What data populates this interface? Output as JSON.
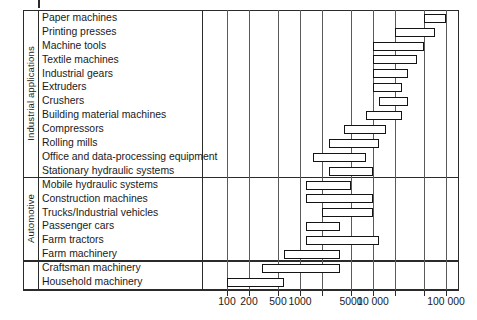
{
  "chart_data": {
    "type": "bar",
    "orientation": "horizontal",
    "title": "",
    "xlabel": "",
    "ylabel": "",
    "xscale": "log",
    "xlim": [
      100,
      150000
    ],
    "grid": true,
    "legend": null,
    "axis_ticks": [
      {
        "value": 100,
        "label": "100"
      },
      {
        "value": 200,
        "label": "200"
      },
      {
        "value": 500,
        "label": "500"
      },
      {
        "value": 1000,
        "label": "1000"
      },
      {
        "value": 5000,
        "label": "5000"
      },
      {
        "value": 10000,
        "label": "10 000"
      },
      {
        "value": 100000,
        "label": "100 000"
      }
    ],
    "gridline_values": [
      100,
      200,
      500,
      1000,
      2000,
      5000,
      10000,
      20000,
      50000,
      100000
    ],
    "groups": [
      {
        "name": "Industrial applications",
        "rows": 12
      },
      {
        "name": "Automotive",
        "rows": 6
      },
      {
        "name": "",
        "rows": 2
      }
    ],
    "categories": [
      "Paper machines",
      "Printing presses",
      "Machine tools",
      "Textile machines",
      "Industrial gears",
      "Extruders",
      "Crushers",
      "Building material machines",
      "Compressors",
      "Rolling mills",
      "Office and data-processing equipment",
      "Stationary hydraulic systems",
      "Mobile hydraulic systems",
      "Construction machines",
      "Trucks/Industrial vehicles",
      "Passenger cars",
      "Farm tractors",
      "Farm machinery",
      "Craftsman machinery",
      "Household machinery"
    ],
    "ranges": [
      {
        "category": "Paper machines",
        "low": 50000,
        "high": 100000
      },
      {
        "category": "Printing presses",
        "low": 20000,
        "high": 70000
      },
      {
        "category": "Machine tools",
        "low": 10000,
        "high": 50000
      },
      {
        "category": "Textile machines",
        "low": 10000,
        "high": 40000
      },
      {
        "category": "Industrial gears",
        "low": 10000,
        "high": 30000
      },
      {
        "category": "Extruders",
        "low": 10000,
        "high": 25000
      },
      {
        "category": "Crushers",
        "low": 12000,
        "high": 30000
      },
      {
        "category": "Building material machines",
        "low": 8000,
        "high": 25000
      },
      {
        "category": "Compressors",
        "low": 4000,
        "high": 15000
      },
      {
        "category": "Rolling mills",
        "low": 2500,
        "high": 12000
      },
      {
        "category": "Office and data-processing equipment",
        "low": 1500,
        "high": 8000
      },
      {
        "category": "Stationary hydraulic systems",
        "low": 2500,
        "high": 10000
      },
      {
        "category": "Mobile hydraulic systems",
        "low": 1200,
        "high": 5000
      },
      {
        "category": "Construction machines",
        "low": 1200,
        "high": 10000
      },
      {
        "category": "Trucks/Industrial vehicles",
        "low": 2000,
        "high": 10000
      },
      {
        "category": "Passenger cars",
        "low": 1200,
        "high": 3500
      },
      {
        "category": "Farm tractors",
        "low": 1200,
        "high": 12000
      },
      {
        "category": "Farm machinery",
        "low": 600,
        "high": 3500
      },
      {
        "category": "Craftsman machinery",
        "low": 300,
        "high": 3500
      },
      {
        "category": "Household machinery",
        "low": 100,
        "high": 600
      }
    ]
  }
}
